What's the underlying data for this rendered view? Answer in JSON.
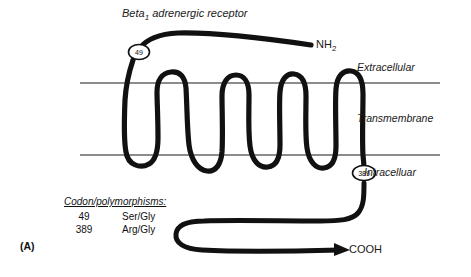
{
  "figure": {
    "panel_label": "(A)",
    "title_main": "Beta",
    "title_subscript": "1",
    "title_rest": " adrenergic receptor"
  },
  "terminals": {
    "n_terminus": "NH",
    "n_terminus_sub": "2",
    "c_terminus": "COOH"
  },
  "membrane_regions": {
    "extracellular": "Extracellular",
    "transmembrane": "Transmembrane",
    "intracellular": "Intracelluar"
  },
  "markers": [
    {
      "id": "marker-49",
      "label": "49"
    },
    {
      "id": "marker-389",
      "label": "389"
    }
  ],
  "codon_panel": {
    "heading": "Codon/polymorphisms:",
    "rows": [
      {
        "codon": "49",
        "variant": "Ser/Gly"
      },
      {
        "codon": "389",
        "variant": "Arg/Gly"
      }
    ]
  },
  "colors": {
    "backbone": "#111111",
    "membrane_line": "#1a1a1a",
    "text": "#1a1a1a",
    "background": "#ffffff"
  }
}
